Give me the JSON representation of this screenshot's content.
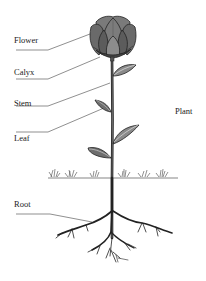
{
  "diagram": {
    "title": "Plant",
    "labels": [
      {
        "id": "flower",
        "text": "Flower"
      },
      {
        "id": "calyx",
        "text": "Calyx"
      },
      {
        "id": "stem",
        "text": "Stem"
      },
      {
        "id": "leaf",
        "text": "Leaf"
      },
      {
        "id": "root",
        "text": "Root"
      }
    ],
    "colors": {
      "ink": "#222222",
      "petal": "#6e6e6e",
      "petal_dark": "#4a4a4a",
      "leaf": "#8a8a8a",
      "background": "#ffffff"
    }
  }
}
